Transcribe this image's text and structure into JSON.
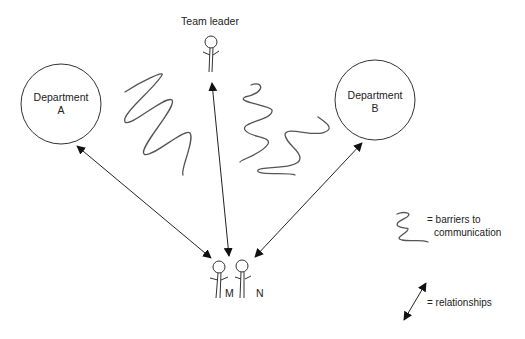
{
  "diagram": {
    "type": "relationship-barrier-diagram",
    "nodes": {
      "team_leader": {
        "label": "Team leader"
      },
      "department_a": {
        "label_line1": "Department",
        "label_line2": "A"
      },
      "department_b": {
        "label_line1": "Department",
        "label_line2": "B"
      },
      "person_m": {
        "label": "M"
      },
      "person_n": {
        "label": "N"
      }
    },
    "edges": [
      {
        "from": "department_a",
        "to": "person_m",
        "kind": "relationship",
        "bidirectional": true
      },
      {
        "from": "team_leader",
        "to": "person_m",
        "kind": "relationship",
        "bidirectional": true
      },
      {
        "from": "department_b",
        "to": "person_n",
        "kind": "relationship",
        "bidirectional": true
      }
    ],
    "barriers": [
      {
        "between": [
          "department_a-edge",
          "team_leader-edge"
        ]
      },
      {
        "between": [
          "team_leader-edge",
          "department_b-edge"
        ]
      },
      {
        "between": [
          "team_leader-edge",
          "department_b-edge"
        ]
      }
    ],
    "legend": {
      "barrier_line1": "= barriers to",
      "barrier_line2": "communication",
      "relationship": "= relationships"
    },
    "colors": {
      "line": "#222222",
      "squiggle": "#555555",
      "background": "#ffffff"
    }
  }
}
